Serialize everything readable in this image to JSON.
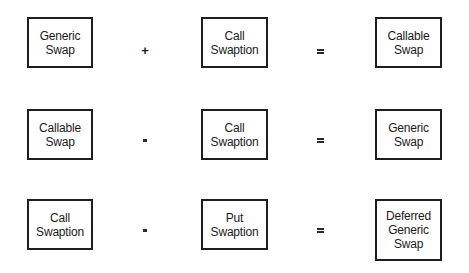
{
  "diagram": {
    "type": "equation-grid",
    "rows": [
      {
        "left": {
          "lines": [
            "Generic",
            "Swap"
          ]
        },
        "operator": "+",
        "middle": {
          "lines": [
            "Call",
            "Swaption"
          ]
        },
        "equals": "=",
        "result": {
          "lines": [
            "Callable",
            "Swap"
          ]
        }
      },
      {
        "left": {
          "lines": [
            "Callable",
            "Swap"
          ]
        },
        "operator": "-",
        "middle": {
          "lines": [
            "Call",
            "Swaption"
          ]
        },
        "equals": "=",
        "result": {
          "lines": [
            "Generic",
            "Swap"
          ]
        }
      },
      {
        "left": {
          "lines": [
            "Call",
            "Swaption"
          ]
        },
        "operator": "-",
        "middle": {
          "lines": [
            "Put",
            "Swaption"
          ]
        },
        "equals": "=",
        "result": {
          "lines": [
            "Deferred",
            "Generic",
            "Swap"
          ]
        }
      }
    ]
  },
  "colors": {
    "border": "#1e1e1e",
    "text": "#1a1a1a",
    "background": "#ffffff"
  }
}
